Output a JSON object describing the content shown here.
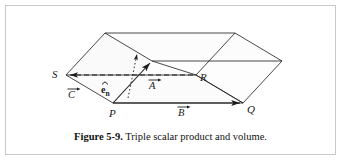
{
  "figure": {
    "caption_label": "Figure 5-9.",
    "caption_text": "Triple scalar product and volume.",
    "frame_color": "#c9c9c9",
    "background": "#ffffff",
    "ink_color": "#1a1a1a",
    "face_shade": "#fbfbfb"
  },
  "labels": {
    "point_s": "S",
    "point_p": "P",
    "point_q": "Q",
    "point_r": "R",
    "vector_a": "A",
    "vector_b": "B",
    "vector_c": "C",
    "unit_normal_e": "e",
    "unit_normal_sub": "n"
  },
  "geometry": {
    "type": "parallelepiped",
    "description": "Triple scalar product volume diagram: parallelepiped with base vertices P, Q, R, S and vectors A, B, C from P, plus unit normal e-hat-n.",
    "vertices": {
      "P": [
        113,
        103
      ],
      "Q": [
        243,
        103
      ],
      "R": [
        196,
        75
      ],
      "S": [
        66,
        75
      ],
      "A_tip": [
        152,
        61
      ],
      "top_front_left": [
        152,
        61
      ],
      "top_front_right": [
        282,
        61
      ],
      "top_back_left": [
        105,
        33
      ],
      "top_back_right": [
        235,
        33
      ]
    },
    "vectors": [
      {
        "name": "A",
        "from": "P",
        "to": "A_tip",
        "style": "solid-arrow"
      },
      {
        "name": "B",
        "from": "P",
        "to": "Q",
        "style": "solid-arrow"
      },
      {
        "name": "C",
        "from": "P",
        "to": "S",
        "style": "dashed-arrow"
      }
    ],
    "normal": {
      "name": "e_n",
      "style": "dotted-arrow",
      "from": [
        129,
        97
      ],
      "to": [
        137,
        52
      ]
    }
  }
}
